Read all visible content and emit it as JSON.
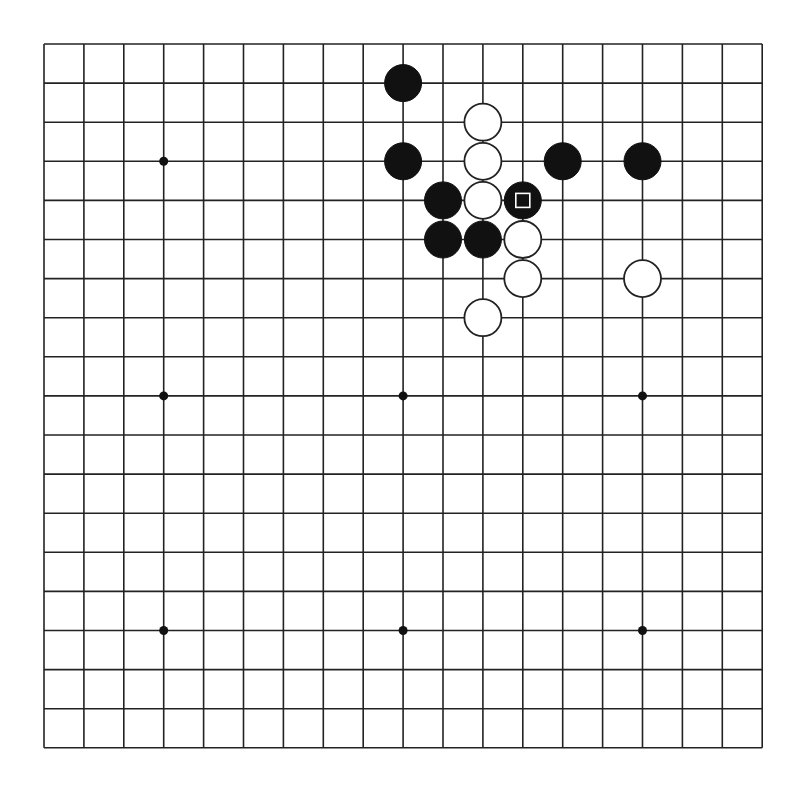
{
  "board": {
    "size": 19,
    "origin_x": 44,
    "origin_y": 44,
    "spacing_x": 39.9,
    "spacing_y": 39.1,
    "line_color": "#222222",
    "background": "#ffffff",
    "star_points": [
      [
        3,
        3
      ],
      [
        9,
        3
      ],
      [
        15,
        3
      ],
      [
        3,
        9
      ],
      [
        9,
        9
      ],
      [
        15,
        9
      ],
      [
        3,
        15
      ],
      [
        9,
        15
      ],
      [
        15,
        15
      ]
    ],
    "stones": [
      {
        "color": "black",
        "col": 9,
        "row": 1
      },
      {
        "color": "white",
        "col": 11,
        "row": 2
      },
      {
        "color": "black",
        "col": 9,
        "row": 3
      },
      {
        "color": "white",
        "col": 11,
        "row": 3
      },
      {
        "color": "black",
        "col": 13,
        "row": 3
      },
      {
        "color": "black",
        "col": 15,
        "row": 3
      },
      {
        "color": "black",
        "col": 10,
        "row": 4
      },
      {
        "color": "white",
        "col": 11,
        "row": 4
      },
      {
        "color": "black",
        "col": 12,
        "row": 4,
        "marker": "square"
      },
      {
        "color": "black",
        "col": 10,
        "row": 5
      },
      {
        "color": "black",
        "col": 11,
        "row": 5
      },
      {
        "color": "white",
        "col": 12,
        "row": 5
      },
      {
        "color": "white",
        "col": 12,
        "row": 6
      },
      {
        "color": "white",
        "col": 15,
        "row": 6
      },
      {
        "color": "white",
        "col": 11,
        "row": 7
      }
    ],
    "last_move": {
      "col": 12,
      "row": 4,
      "marker": "square"
    }
  }
}
